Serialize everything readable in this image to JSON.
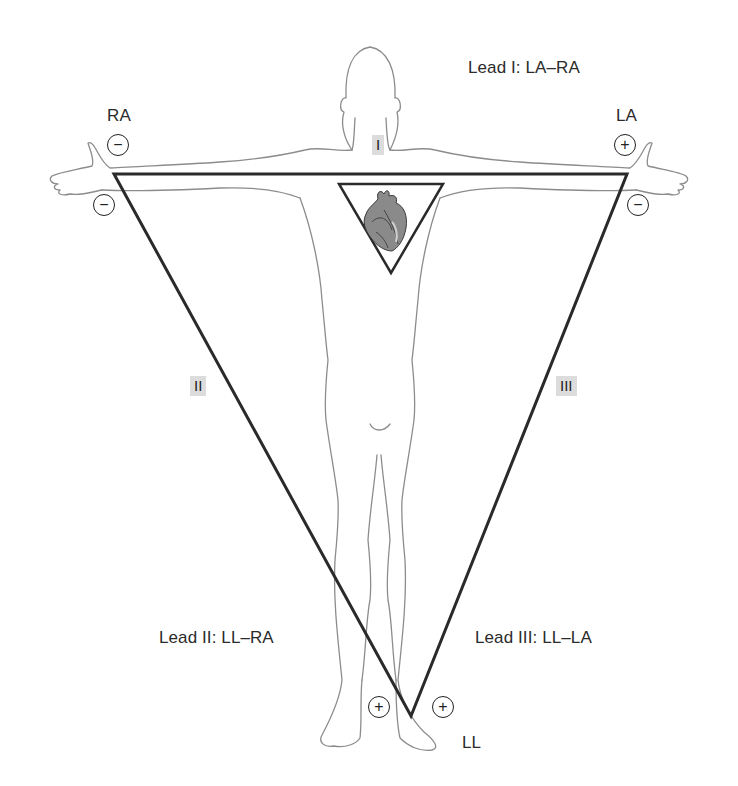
{
  "leads": {
    "lead_I": "Lead I: LA–RA",
    "lead_II": "Lead II: LL–RA",
    "lead_III": "Lead III: LL–LA"
  },
  "electrode_labels": {
    "ra": "RA",
    "la": "LA",
    "ll": "LL"
  },
  "roman_labels": {
    "i": "I",
    "ii": "II",
    "iii": "III"
  },
  "electrodes": {
    "ra_upper": "−",
    "ra_lower": "−",
    "la_upper": "+",
    "la_lower": "−",
    "ll_left": "+",
    "ll_right": "+"
  },
  "colors": {
    "triangle_stroke": "#2a2a2a",
    "body_outline": "#8c8c8c",
    "label_bg": "#dcdcdc"
  }
}
